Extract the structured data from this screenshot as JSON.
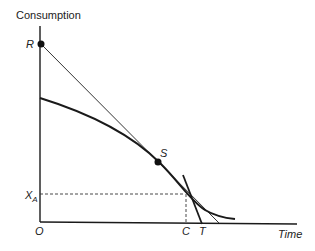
{
  "diagram": {
    "y_axis_label": "Consumption",
    "x_axis_label": "Time",
    "origin_label": "O",
    "points": {
      "R": "R",
      "S": "S",
      "C": "C",
      "T": "T",
      "X_A_main": "X",
      "X_A_sub": "A"
    },
    "elements": [
      "vertical consumption axis",
      "horizontal time axis",
      "thin straight line from R tangent to the curve at S",
      "thick concave curve through S",
      "steep thick line meeting the time axis at T",
      "dashed horizontal guide at X_A",
      "dashed vertical guide at C"
    ],
    "colors": {
      "ink": "#1a1a1a",
      "thin_line": "#333333"
    }
  }
}
